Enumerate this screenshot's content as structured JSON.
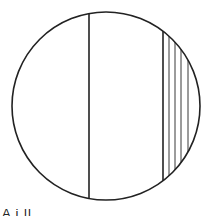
{
  "diagram": {
    "circle": {
      "cx": 106,
      "cy": 106,
      "r": 94
    },
    "main_chord_x": 89,
    "hatch_boundary_x": 163,
    "hatch_lines_x": [
      169,
      175,
      181,
      188
    ],
    "stroke_color": "#222222"
  },
  "caption": {
    "text": "A  i                      ll                              "
  }
}
